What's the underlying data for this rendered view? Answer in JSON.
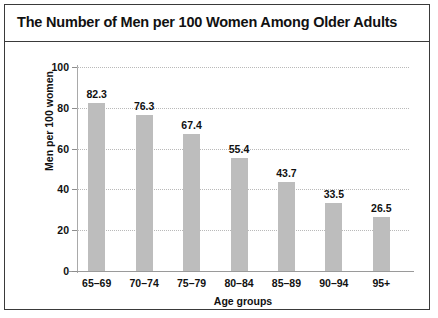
{
  "figure": {
    "border_color": "#3a3a3a",
    "background": "#ffffff"
  },
  "chart_data": {
    "type": "bar",
    "title": "The Number of Men per 100 Women Among Older Adults",
    "xlabel": "Age groups",
    "ylabel": "Men per 100 women",
    "categories": [
      "65–69",
      "70–74",
      "75–79",
      "80–84",
      "85–89",
      "90–94",
      "95+"
    ],
    "values": [
      82.3,
      76.3,
      67.4,
      55.4,
      43.7,
      33.5,
      26.5
    ],
    "value_labels": [
      "82.3",
      "76.3",
      "67.4",
      "55.4",
      "43.7",
      "33.5",
      "26.5"
    ],
    "ylim": [
      0,
      100
    ],
    "yticks": [
      0,
      20,
      40,
      60,
      80,
      100
    ],
    "ytick_labels": [
      "0",
      "20",
      "40",
      "60",
      "80",
      "100"
    ],
    "grid": true,
    "grid_style": "dotted",
    "grid_color": "#b9b9b9",
    "legend": "none",
    "bar_color": "#bdbdbd",
    "axis_color": "#9a9a9a"
  }
}
